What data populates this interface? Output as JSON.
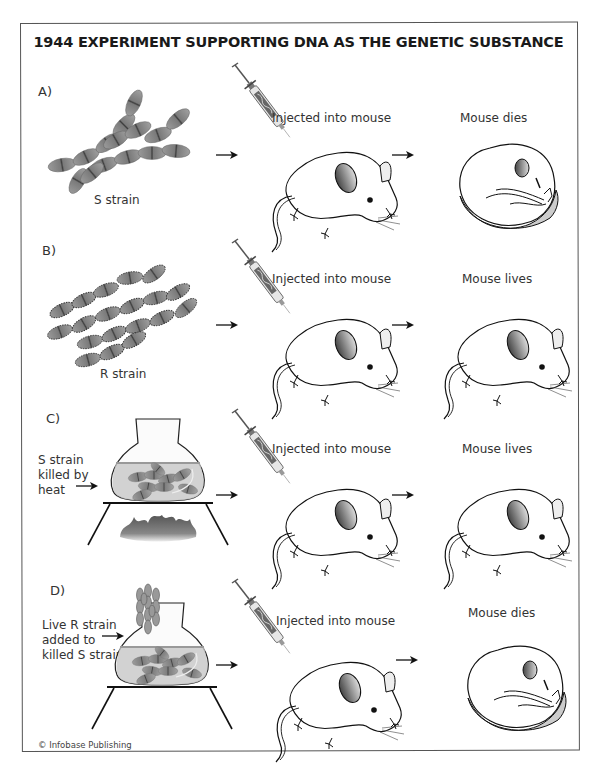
{
  "figure": {
    "title": "1944 EXPERIMENT SUPPORTING DNA AS THE GENETIC SUBSTANCE",
    "credit": "© Infobase Publishing"
  },
  "colors": {
    "border": "#555555",
    "bacteria_fill": "#8a8a8a",
    "bacteria_dark": "#4a4a4a",
    "liquid": "#c9c9c9",
    "ink": "#1a1a1a"
  },
  "panels": [
    {
      "label": "A)",
      "source": "S strain",
      "source_icon": "s-strain-bacteria-icon",
      "step": "Injected into mouse",
      "result": "Mouse dies",
      "result_icon": "dead-mouse-icon"
    },
    {
      "label": "B)",
      "source": "R strain",
      "source_icon": "r-strain-bacteria-icon",
      "step": "Injected into mouse",
      "result": "Mouse lives",
      "result_icon": "live-mouse-icon"
    },
    {
      "label": "C)",
      "source_lines": [
        "S strain",
        "killed by",
        "heat"
      ],
      "source_icon": "heated-flask-icon",
      "step": "Injected into mouse",
      "result": "Mouse lives",
      "result_icon": "live-mouse-icon"
    },
    {
      "label": "D)",
      "source_lines": [
        "Live R strain",
        "added to",
        "killed S strain"
      ],
      "source_icon": "flask-with-r-strain-icon",
      "step": "Injected into mouse",
      "result": "Mouse dies",
      "result_icon": "dead-mouse-icon"
    }
  ]
}
